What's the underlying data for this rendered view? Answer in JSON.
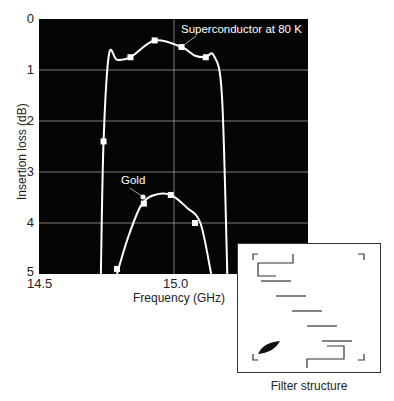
{
  "chart_data": {
    "type": "line",
    "title": "",
    "xlabel": "Frequency (GHz)",
    "ylabel": "Insertion loss (dB)",
    "xlim": [
      14.5,
      15.5
    ],
    "ylim": [
      0,
      5
    ],
    "y_inverted": true,
    "grid": true,
    "background": "#000000",
    "x_ticks": [
      "14.5",
      "15.0"
    ],
    "y_ticks": [
      "0",
      "1",
      "2",
      "3",
      "4",
      "5"
    ],
    "series": [
      {
        "name": "Superconductor at 80 K",
        "color": "#ffffff",
        "x": [
          14.73,
          14.74,
          14.76,
          14.79,
          14.84,
          14.93,
          15.03,
          15.08,
          15.12,
          15.15,
          15.18,
          15.2
        ],
        "y": [
          5.0,
          2.4,
          0.7,
          0.8,
          0.75,
          0.42,
          0.55,
          0.72,
          0.75,
          0.72,
          1.5,
          5.0
        ],
        "markers_x": [
          14.74,
          14.84,
          14.93,
          15.03,
          15.12
        ],
        "markers_y": [
          2.4,
          0.75,
          0.42,
          0.55,
          0.75
        ]
      },
      {
        "name": "Gold",
        "color": "#ffffff",
        "x": [
          14.79,
          14.83,
          14.88,
          14.93,
          14.99,
          15.05,
          15.1,
          15.14
        ],
        "y": [
          5.0,
          4.3,
          3.65,
          3.45,
          3.45,
          3.7,
          4.0,
          5.0
        ],
        "markers_x": [
          14.79,
          14.89,
          14.99,
          15.08
        ],
        "markers_y": [
          4.9,
          3.62,
          3.45,
          4.0
        ]
      }
    ],
    "annotations": [
      {
        "text": "Superconductor at 80 K",
        "x": 15.02,
        "y": 0.2
      },
      {
        "text": "Gold",
        "x": 14.86,
        "y": 3.1
      }
    ]
  },
  "axis": {
    "ylabel": "Insertion loss (dB)",
    "xlabel": "Frequency (GHz)",
    "y_ticks": [
      "0",
      "1",
      "2",
      "3",
      "4",
      "5"
    ],
    "x_ticks": [
      "14.5",
      "15.0"
    ]
  },
  "annotations": {
    "superconductor": "Superconductor at 80 K",
    "gold": "Gold"
  },
  "inset": {
    "caption": "Filter structure"
  }
}
